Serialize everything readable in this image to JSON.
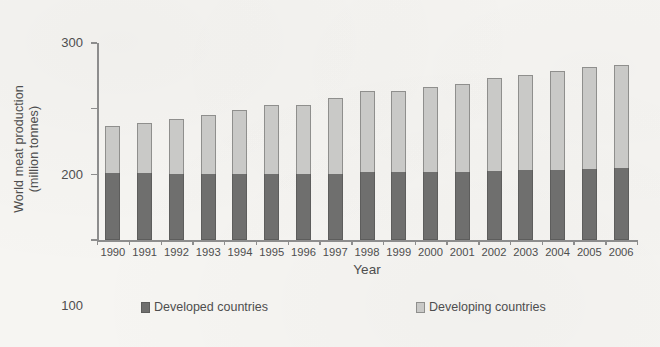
{
  "chart_data": {
    "type": "bar",
    "stacked": true,
    "title": "",
    "xlabel": "Year",
    "ylabel": "World meat production (million tonnes)",
    "ylabel_line1": "World meat production",
    "ylabel_line2": "(million tonnes)",
    "ylim": [
      0,
      300
    ],
    "yticks": [
      0,
      100,
      200,
      300
    ],
    "ytick_labels": [
      "0",
      "100",
      "200",
      "300"
    ],
    "grid": false,
    "legend_position": "bottom",
    "categories": [
      "1990",
      "1991",
      "1992",
      "1993",
      "1994",
      "1995",
      "1996",
      "1997",
      "1998",
      "1999",
      "2000",
      "2001",
      "2002",
      "2003",
      "2004",
      "2005",
      "2006"
    ],
    "series": [
      {
        "name": "Developed countries",
        "color": "#6f6f6e",
        "values": [
          102,
          102,
          101,
          101,
          101,
          100,
          100,
          101,
          103,
          103,
          103,
          103,
          105,
          106,
          107,
          108,
          109
        ]
      },
      {
        "name": "Developing countries",
        "color": "#c9c9c7",
        "values": [
          71,
          76,
          83,
          90,
          97,
          105,
          105,
          115,
          124,
          124,
          130,
          134,
          141,
          145,
          151,
          156,
          158
        ]
      }
    ],
    "totals": [
      173,
      178,
      184,
      191,
      198,
      205,
      205,
      216,
      227,
      227,
      233,
      237,
      246,
      251,
      258,
      264,
      267
    ]
  },
  "legend": {
    "items": [
      {
        "label": "Developed countries",
        "swatch": "dark-square-icon"
      },
      {
        "label": "Developing countries",
        "swatch": "light-square-icon"
      }
    ]
  }
}
